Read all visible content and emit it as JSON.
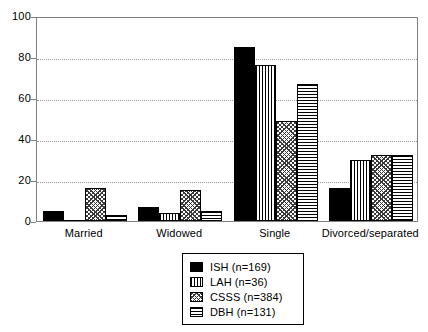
{
  "chart_data": {
    "type": "bar",
    "title": "",
    "subtitle": "",
    "xlabel": "",
    "ylabel": "",
    "ylim": [
      0,
      100
    ],
    "yticks": [
      0,
      20,
      40,
      60,
      80,
      100
    ],
    "grid": true,
    "grid_axis": "y",
    "legend_position": "bottom-center",
    "categories": [
      "Married",
      "Widowed",
      "Single",
      "Divorced/separated"
    ],
    "series": [
      {
        "name": "ISH (n=169)",
        "short_name": "ISH",
        "n": 169,
        "pattern": "solid",
        "values": [
          5,
          7,
          85,
          16
        ]
      },
      {
        "name": "LAH (n=36)",
        "short_name": "LAH",
        "n": 36,
        "pattern": "vertical-stripes",
        "values": [
          0,
          4,
          76,
          30
        ]
      },
      {
        "name": "CSSS (n=384)",
        "short_name": "CSSS",
        "n": 384,
        "pattern": "cross-hatch",
        "values": [
          16,
          15,
          49,
          32
        ]
      },
      {
        "name": "DBH (n=131)",
        "short_name": "DBH",
        "n": 131,
        "pattern": "horizontal-stripes",
        "values": [
          3,
          5,
          67,
          32
        ]
      }
    ]
  },
  "axis": {
    "y_tick_labels": [
      "0",
      "20",
      "40",
      "60",
      "80",
      "100"
    ],
    "x_tick_labels": [
      "Married",
      "Widowed",
      "Single",
      "Divorced/separated"
    ]
  },
  "legend": {
    "entries": [
      {
        "label": "ISH (n=169)",
        "swatch": "solid-swatch"
      },
      {
        "label": "LAH (n=36)",
        "swatch": "vertical-stripes-swatch"
      },
      {
        "label": "CSSS (n=384)",
        "swatch": "cross-hatch-swatch"
      },
      {
        "label": "DBH (n=131)",
        "swatch": "horizontal-stripes-swatch"
      }
    ]
  },
  "colors": {
    "ink": "#000000",
    "frame": "#808080",
    "grid": "#9a9a9a",
    "background": "#ffffff"
  }
}
